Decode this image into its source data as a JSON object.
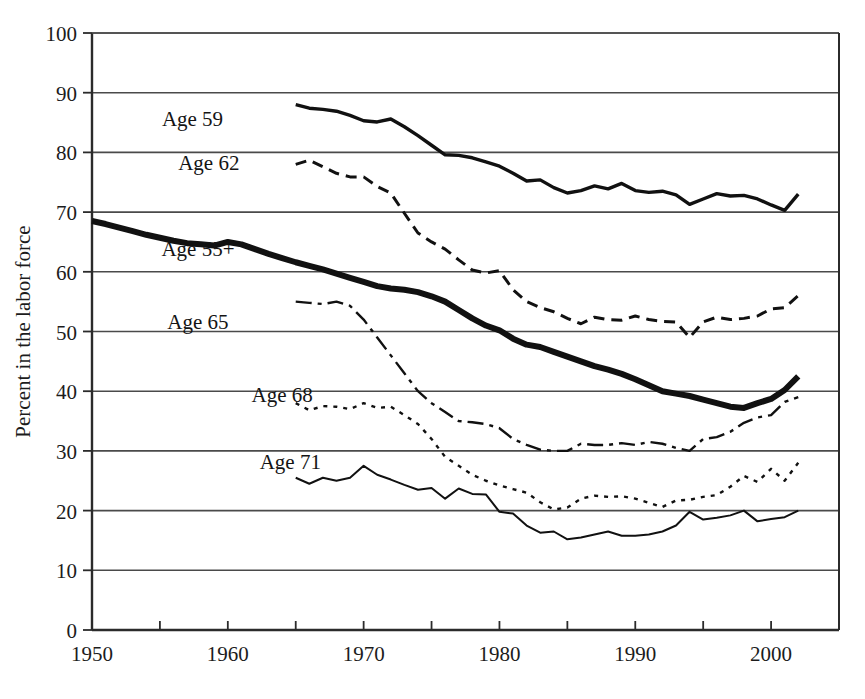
{
  "chart_data": {
    "type": "line",
    "title": "",
    "subtitle": "",
    "xlabel": "",
    "ylabel": "Percent in the labor force",
    "xlim": [
      1950,
      2005
    ],
    "ylim": [
      0,
      100
    ],
    "grid": "horizontal",
    "legend_position": "inline-labels",
    "y_ticks": [
      0,
      10,
      20,
      30,
      40,
      50,
      60,
      70,
      80,
      90,
      100
    ],
    "y_tick_labels": [
      "0",
      "10",
      "20",
      "30",
      "40",
      "50",
      "60",
      "70",
      "80",
      "90",
      "100"
    ],
    "x_ticks": [
      1950,
      1955,
      1960,
      1965,
      1970,
      1975,
      1980,
      1985,
      1990,
      1995,
      2000,
      2005
    ],
    "x_tick_labels": [
      "1950",
      "",
      "1960",
      "",
      "1970",
      "",
      "1980",
      "",
      "1990",
      "",
      "2000",
      ""
    ],
    "x_labeled_ticks": [
      1950,
      1960,
      1970,
      1980,
      1990,
      2000
    ],
    "series": [
      {
        "name": "Age 59",
        "label": "Age 59",
        "style": "solid-thick",
        "stroke_width": 3.4,
        "dash": "none",
        "label_x": 1957.4,
        "label_y": 85.6,
        "x": [
          1965,
          1966,
          1967,
          1968,
          1969,
          1970,
          1971,
          1972,
          1973,
          1974,
          1975,
          1976,
          1977,
          1978,
          1979,
          1980,
          1981,
          1982,
          1983,
          1984,
          1985,
          1986,
          1987,
          1988,
          1989,
          1990,
          1991,
          1992,
          1993,
          1994,
          1995,
          1996,
          1997,
          1998,
          1999,
          2000,
          2001,
          2002
        ],
        "y": [
          88.0,
          87.4,
          87.2,
          86.9,
          86.2,
          85.3,
          85.1,
          85.6,
          84.3,
          82.8,
          81.2,
          79.6,
          79.5,
          79.1,
          78.4,
          77.7,
          76.5,
          75.2,
          75.4,
          74.1,
          73.2,
          73.6,
          74.4,
          73.9,
          74.8,
          73.6,
          73.3,
          73.5,
          72.9,
          71.3,
          72.2,
          73.1,
          72.7,
          72.8,
          72.2,
          71.2,
          70.3,
          73.0
        ]
      },
      {
        "name": "Age 62",
        "label": "Age 62",
        "style": "dashed",
        "stroke_width": 3.0,
        "dash": "11 7",
        "label_x": 1958.6,
        "label_y": 78.3,
        "x": [
          1965,
          1966,
          1967,
          1968,
          1969,
          1970,
          1971,
          1972,
          1973,
          1974,
          1975,
          1976,
          1977,
          1978,
          1979,
          1980,
          1981,
          1982,
          1983,
          1984,
          1985,
          1986,
          1987,
          1988,
          1989,
          1990,
          1991,
          1992,
          1993,
          1994,
          1995,
          1996,
          1997,
          1998,
          1999,
          2000,
          2001,
          2002
        ],
        "y": [
          78.0,
          78.7,
          77.6,
          76.5,
          75.9,
          75.9,
          74.3,
          73.2,
          69.8,
          66.5,
          65.0,
          63.8,
          62.0,
          60.3,
          59.8,
          60.2,
          57.0,
          55.0,
          54.0,
          53.3,
          52.2,
          51.3,
          52.4,
          52.0,
          51.9,
          52.6,
          52.0,
          51.7,
          51.6,
          49.0,
          51.6,
          52.4,
          52.0,
          52.2,
          52.6,
          53.8,
          54.0,
          56.0
        ]
      },
      {
        "name": "Age 55+",
        "label": "Age 55+",
        "style": "solid-extra-thick",
        "stroke_width": 6.0,
        "dash": "none",
        "label_x": 1957.8,
        "label_y": 63.9,
        "x": [
          1950,
          1951,
          1952,
          1953,
          1954,
          1955,
          1956,
          1957,
          1958,
          1959,
          1960,
          1961,
          1962,
          1963,
          1964,
          1965,
          1966,
          1967,
          1968,
          1969,
          1970,
          1971,
          1972,
          1973,
          1974,
          1975,
          1976,
          1977,
          1978,
          1979,
          1980,
          1981,
          1982,
          1983,
          1984,
          1985,
          1986,
          1987,
          1988,
          1989,
          1990,
          1991,
          1992,
          1993,
          1994,
          1995,
          1996,
          1997,
          1998,
          1999,
          2000,
          2001,
          2002
        ],
        "y": [
          68.5,
          68.0,
          67.4,
          66.8,
          66.2,
          65.7,
          65.2,
          64.8,
          64.6,
          64.4,
          65.0,
          64.6,
          63.8,
          63.0,
          62.3,
          61.6,
          61.0,
          60.4,
          59.7,
          59.0,
          58.3,
          57.6,
          57.2,
          57.0,
          56.6,
          55.9,
          55.0,
          53.6,
          52.2,
          51.0,
          50.2,
          48.8,
          47.8,
          47.4,
          46.6,
          45.8,
          45.0,
          44.2,
          43.6,
          42.9,
          42.0,
          41.0,
          40.0,
          39.6,
          39.2,
          38.6,
          38.0,
          37.4,
          37.2,
          38.0,
          38.7,
          40.2,
          42.5
        ]
      },
      {
        "name": "Age 65",
        "label": "Age 65",
        "style": "dash-dot",
        "stroke_width": 2.4,
        "dash": "16 6 4 6",
        "label_x": 1957.8,
        "label_y": 51.6,
        "x": [
          1965,
          1966,
          1967,
          1968,
          1969,
          1970,
          1971,
          1972,
          1973,
          1974,
          1975,
          1976,
          1977,
          1978,
          1979,
          1980,
          1981,
          1982,
          1983,
          1984,
          1985,
          1986,
          1987,
          1988,
          1989,
          1990,
          1991,
          1992,
          1993,
          1994,
          1995,
          1996,
          1997,
          1998,
          1999,
          2000,
          2001,
          2002
        ],
        "y": [
          55.0,
          54.8,
          54.6,
          55.0,
          54.3,
          52.0,
          49.0,
          46.0,
          43.0,
          40.0,
          38.0,
          36.5,
          35.0,
          34.8,
          34.5,
          33.8,
          32.0,
          31.0,
          30.2,
          30.0,
          30.0,
          31.2,
          31.0,
          31.0,
          31.3,
          31.0,
          31.5,
          31.2,
          30.5,
          30.0,
          32.0,
          32.3,
          33.2,
          34.7,
          35.6,
          36.0,
          38.2,
          39.0
        ]
      },
      {
        "name": "Age 68",
        "label": "Age 68",
        "style": "dotted",
        "stroke_width": 2.4,
        "dash": "4 6",
        "label_x": 1964.0,
        "label_y": 39.4,
        "x": [
          1965,
          1966,
          1967,
          1968,
          1969,
          1970,
          1971,
          1972,
          1973,
          1974,
          1975,
          1976,
          1977,
          1978,
          1979,
          1980,
          1981,
          1982,
          1983,
          1984,
          1985,
          1986,
          1987,
          1988,
          1989,
          1990,
          1991,
          1992,
          1993,
          1994,
          1995,
          1996,
          1997,
          1998,
          1999,
          2000,
          2001,
          2002
        ],
        "y": [
          38.0,
          36.8,
          37.5,
          37.4,
          37.0,
          38.0,
          37.2,
          37.4,
          36.0,
          34.5,
          32.0,
          29.0,
          27.5,
          26.0,
          25.0,
          24.2,
          23.6,
          23.0,
          21.4,
          20.2,
          20.5,
          22.0,
          22.5,
          22.3,
          22.4,
          22.0,
          21.3,
          20.6,
          21.7,
          21.8,
          22.3,
          22.6,
          24.0,
          25.8,
          24.8,
          27.0,
          25.0,
          28.0
        ]
      },
      {
        "name": "Age 71",
        "label": "Age 71",
        "style": "solid-thin",
        "stroke_width": 2.0,
        "dash": "none",
        "label_x": 1964.6,
        "label_y": 28.2,
        "x": [
          1965,
          1966,
          1967,
          1968,
          1969,
          1970,
          1971,
          1972,
          1973,
          1974,
          1975,
          1976,
          1977,
          1978,
          1979,
          1980,
          1981,
          1982,
          1983,
          1984,
          1985,
          1986,
          1987,
          1988,
          1989,
          1990,
          1991,
          1992,
          1993,
          1994,
          1995,
          1996,
          1997,
          1998,
          1999,
          2000,
          2001,
          2002
        ],
        "y": [
          25.5,
          24.5,
          25.5,
          25.0,
          25.5,
          27.5,
          26.0,
          25.2,
          24.3,
          23.5,
          23.8,
          22.0,
          23.7,
          22.8,
          22.7,
          19.8,
          19.5,
          17.5,
          16.3,
          16.5,
          15.2,
          15.5,
          16.0,
          16.5,
          15.8,
          15.8,
          16.0,
          16.5,
          17.5,
          19.8,
          18.5,
          18.8,
          19.2,
          20.0,
          18.2,
          18.6,
          18.9,
          20.0
        ]
      }
    ]
  }
}
